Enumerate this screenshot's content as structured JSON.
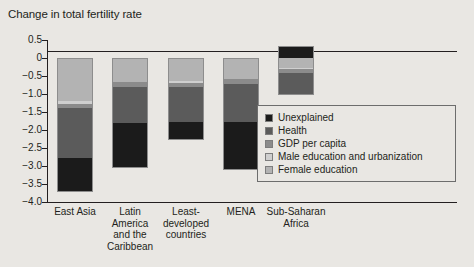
{
  "chart_data": {
    "type": "bar",
    "title": "Change in total fertility rate",
    "xlabel": "",
    "ylabel": "",
    "ylim": [
      -4.0,
      0.5
    ],
    "grid": false,
    "stacked": true,
    "legend_position": "inside-right",
    "yticks": [
      "0.5",
      "0",
      "−0.5",
      "−1.0",
      "−1.5",
      "−2.0",
      "−2.5",
      "−3.0",
      "−3.5",
      "−4.0"
    ],
    "ytick_values": [
      0.5,
      0,
      -0.5,
      -1.0,
      -1.5,
      -2.0,
      -2.5,
      -3.0,
      -3.5,
      -4.0
    ],
    "categories": [
      "East Asia",
      "Latin\nAmerica\nand the\nCaribbean",
      "Least-\ndeveloped\ncountries",
      "MENA",
      "Sub-Saharan\nAfrica"
    ],
    "series": [
      {
        "name": "Unexplained",
        "color": "#1b1b1b",
        "values": [
          -0.95,
          -1.24,
          -0.5,
          -1.32,
          0.32
        ]
      },
      {
        "name": "Health",
        "color": "#5b5b5b",
        "values": [
          -1.4,
          -1.0,
          -0.98,
          -1.06,
          -0.63
        ]
      },
      {
        "name": "GDP per capita",
        "color": "#8b8b8b",
        "values": [
          -0.1,
          -0.13,
          -0.1,
          -0.13,
          -0.11
        ]
      },
      {
        "name": "Male education and urbanization",
        "color": "#cfcfcf",
        "values": [
          -0.08,
          -0.02,
          -0.06,
          -0.01,
          -0.01
        ]
      },
      {
        "name": "Female education",
        "color": "#b3b3b3",
        "values": [
          -1.2,
          -0.66,
          -0.64,
          -0.58,
          -0.29
        ]
      }
    ],
    "totals": [
      -3.73,
      -3.05,
      -2.28,
      -3.1,
      -0.72
    ],
    "annotations": []
  },
  "legend": {
    "items": [
      {
        "label": "Unexplained"
      },
      {
        "label": "Health"
      },
      {
        "label": "GDP per capita"
      },
      {
        "label": "Male education and urbanization"
      },
      {
        "label": "Female education"
      }
    ]
  }
}
